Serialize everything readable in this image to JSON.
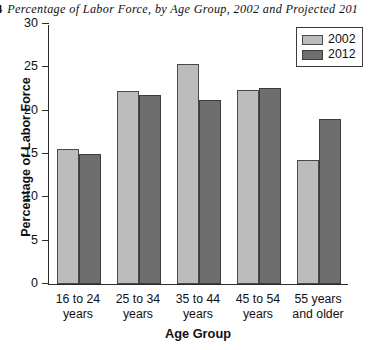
{
  "figure": {
    "number": "4",
    "title": "Percentage of Labor Force, by Age Group, 2002 and Projected 201"
  },
  "chart_data": {
    "type": "bar",
    "title": "Percentage of Labor Force, by Age Group, 2002 and Projected 201",
    "xlabel": "Age Group",
    "ylabel": "Percentage of Labor Force",
    "ylim": [
      0,
      30
    ],
    "yticks": [
      0,
      5,
      10,
      15,
      20,
      25,
      30
    ],
    "ytick_labels": [
      "0",
      "5",
      "10",
      "15",
      "20",
      "25",
      "30"
    ],
    "grid": false,
    "legend_position": "top-right",
    "categories": [
      "16 to 24\nyears",
      "25 to 34\nyears",
      "35 to 44\nyears",
      "45 to 54\nyears",
      "55 years\nand older"
    ],
    "series": [
      {
        "name": "2002",
        "color": "#bcbcbc",
        "values": [
          15.6,
          22.3,
          25.4,
          22.4,
          14.3
        ]
      },
      {
        "name": "2012",
        "color": "#6e6e6e",
        "values": [
          15.0,
          21.8,
          21.2,
          22.6,
          19.0
        ]
      }
    ]
  }
}
